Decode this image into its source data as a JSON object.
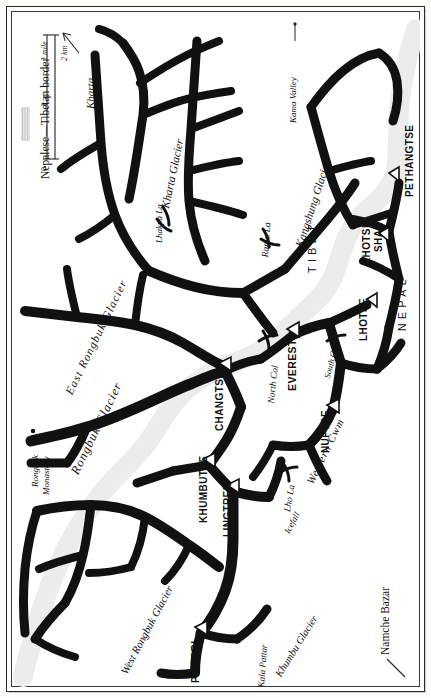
{
  "map": {
    "title": "Everest Region",
    "orientation": "rotated-90-ccw",
    "colors": {
      "glacier": "#111111",
      "border_band": "#d9d9d9",
      "frame": "#2b2b2b",
      "paper": "#ffffff",
      "ink": "#111111"
    }
  },
  "legend": {
    "border_label": "Nepalese—Tibetan border",
    "scale": {
      "miles_ticks": [
        "0",
        "1"
      ],
      "miles_unit": "1 mile",
      "km_ticks": [
        "0",
        "1",
        "2"
      ],
      "km_unit": "2 km"
    }
  },
  "countries": [
    {
      "name": "TIBET"
    },
    {
      "name": "NEPAL"
    }
  ],
  "peaks": [
    {
      "name": "PETHANGTSE"
    },
    {
      "name": "LHOTSE SHAR",
      "line1": "LHOTSE",
      "line2": "SHAR"
    },
    {
      "name": "LHOTSE"
    },
    {
      "name": "EVEREST"
    },
    {
      "name": "NUPTSE"
    },
    {
      "name": "CHANGTSE"
    },
    {
      "name": "KHUMBUTSE"
    },
    {
      "name": "LINGTREN"
    },
    {
      "name": "PUMORI"
    }
  ],
  "glaciers": [
    {
      "name": "Kharta Glacier"
    },
    {
      "name": "Kangshung Glacier"
    },
    {
      "name": "East Rongbuk Glacier"
    },
    {
      "name": "Rongbuk Glacier"
    },
    {
      "name": "West Rongbuk Glacier"
    },
    {
      "name": "Khumbu Glacier"
    }
  ],
  "passes": [
    {
      "name": "Lhakpa La"
    },
    {
      "name": "Rapiu La"
    },
    {
      "name": "North Col"
    },
    {
      "name": "South Col"
    },
    {
      "name": "Lho La"
    }
  ],
  "features": [
    {
      "name": "Kama Valley"
    },
    {
      "name": "Western Cwm"
    },
    {
      "name": "Icefall"
    },
    {
      "name": "Kala Pattar"
    }
  ],
  "places": [
    {
      "name": "Kharta",
      "marker": "arrow"
    },
    {
      "name": "Rongbuk Monastery",
      "line1": "Rongbuk",
      "line2": "Monastery",
      "marker": "dot"
    },
    {
      "name": "Namche Bazar",
      "marker": "arrow"
    }
  ]
}
